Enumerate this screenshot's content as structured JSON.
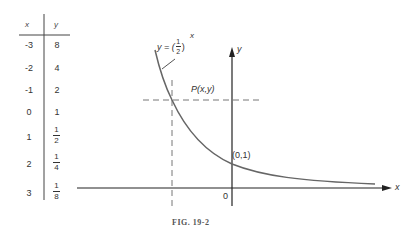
{
  "table": {
    "headers": [
      "x",
      "y"
    ],
    "rows": [
      {
        "x": "-3",
        "y": "8"
      },
      {
        "x": "-2",
        "y": "4"
      },
      {
        "x": "-1",
        "y": "2"
      },
      {
        "x": "0",
        "y": "1"
      },
      {
        "x": "1",
        "y_num": "1",
        "y_den": "2"
      },
      {
        "x": "2",
        "y_num": "1",
        "y_den": "4"
      },
      {
        "x": "3",
        "y_num": "1",
        "y_den": "8"
      }
    ]
  },
  "graph": {
    "curve_label_prefix": "y = (",
    "curve_label_num": "1",
    "curve_label_den": "2",
    "curve_label_suffix": ")",
    "curve_label_exp": "x",
    "point_label": "P(x,y)",
    "intercept_label": "(0,1)",
    "origin_label": "0",
    "x_axis_label": "x",
    "y_axis_label": "y"
  },
  "caption": "FIG. 19-2",
  "colors": {
    "curve": "#666666",
    "axes": "#222222",
    "dashed": "#777777"
  }
}
